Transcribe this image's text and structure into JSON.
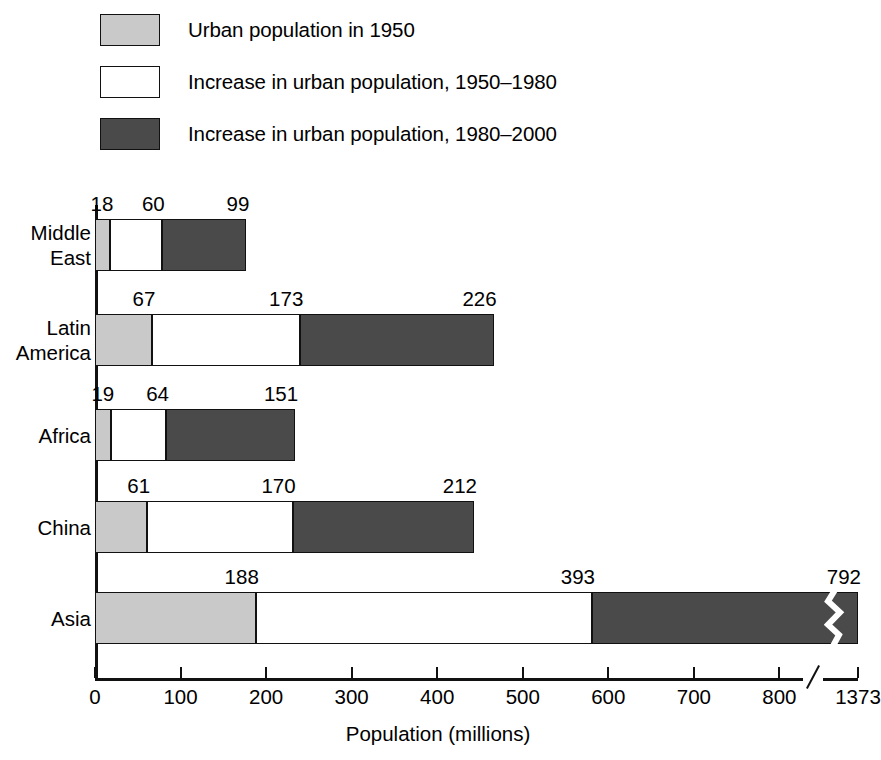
{
  "chart_data": {
    "type": "bar",
    "orientation": "horizontal",
    "stacked": true,
    "title": "",
    "xlabel": "Population (millions)",
    "ylabel": "",
    "xlim": [
      0,
      800
    ],
    "grid": false,
    "legend_position": "top-left",
    "axis_break": {
      "present": true,
      "after_tick": "800",
      "final_tick": "1373"
    },
    "tick_labels": [
      "0",
      "100",
      "200",
      "300",
      "400",
      "500",
      "600",
      "700",
      "800",
      "1373"
    ],
    "tick_values": [
      0,
      100,
      200,
      300,
      400,
      500,
      600,
      700,
      800,
      1373
    ],
    "categories": [
      "Middle East",
      "Latin America",
      "Africa",
      "China",
      "Asia"
    ],
    "series": [
      {
        "name": "Urban population in 1950",
        "color": "#c9c9c9",
        "values": [
          18,
          67,
          19,
          61,
          188
        ]
      },
      {
        "name": "Increase in urban population, 1950–1980",
        "color": "#ffffff",
        "values": [
          60,
          173,
          64,
          170,
          393
        ]
      },
      {
        "name": "Increase in urban population, 1980–2000",
        "color": "#4a4a4a",
        "values": [
          99,
          226,
          151,
          212,
          792
        ]
      }
    ]
  },
  "legend": {
    "items": [
      {
        "label": "Urban population in 1950",
        "swatch": "light"
      },
      {
        "label": "Increase in urban population, 1950–1980",
        "swatch": "white"
      },
      {
        "label": "Increase in urban population, 1980–2000",
        "swatch": "dark"
      }
    ]
  },
  "rows": [
    {
      "label": "Middle\nEast",
      "segments": [
        {
          "value": "18",
          "style": "light"
        },
        {
          "value": "60",
          "style": "white"
        },
        {
          "value": "99",
          "style": "dark"
        }
      ]
    },
    {
      "label": "Latin\nAmerica",
      "segments": [
        {
          "value": "67",
          "style": "light"
        },
        {
          "value": "173",
          "style": "white"
        },
        {
          "value": "226",
          "style": "dark"
        }
      ]
    },
    {
      "label": "Africa",
      "segments": [
        {
          "value": "19",
          "style": "light"
        },
        {
          "value": "64",
          "style": "white"
        },
        {
          "value": "151",
          "style": "dark"
        }
      ]
    },
    {
      "label": "China",
      "segments": [
        {
          "value": "61",
          "style": "light"
        },
        {
          "value": "170",
          "style": "white"
        },
        {
          "value": "212",
          "style": "dark"
        }
      ]
    },
    {
      "label": "Asia",
      "segments": [
        {
          "value": "188",
          "style": "light"
        },
        {
          "value": "393",
          "style": "white"
        },
        {
          "value": "792",
          "style": "dark"
        }
      ]
    }
  ],
  "axis": {
    "title": "Population (millions)",
    "ticks": [
      "0",
      "100",
      "200",
      "300",
      "400",
      "500",
      "600",
      "700",
      "800",
      "1373"
    ]
  },
  "colors": {
    "light": "#c9c9c9",
    "white": "#ffffff",
    "dark": "#4a4a4a",
    "ink": "#111111"
  }
}
